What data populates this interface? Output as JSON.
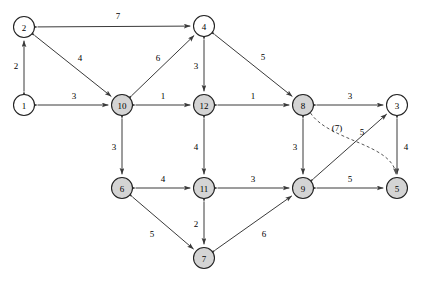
{
  "figure": {
    "width": 422,
    "height": 283,
    "background_color": "#ffffff",
    "node_fill_plain": "#ffffff",
    "node_fill_shaded": "#d4d4d4",
    "edge_color": "#3a3a3a",
    "dashed_edge_color": "#555555"
  },
  "chart_data": {
    "type": "diagram",
    "subtype": "directed-weighted-graph",
    "nodes": [
      {
        "id": "1",
        "label": "1",
        "x": 24,
        "y": 105,
        "style": "plain"
      },
      {
        "id": "2",
        "label": "2",
        "x": 24,
        "y": 27,
        "style": "plain"
      },
      {
        "id": "3",
        "label": "3",
        "x": 397,
        "y": 105,
        "style": "plain"
      },
      {
        "id": "4",
        "label": "4",
        "x": 204,
        "y": 26,
        "style": "plain"
      },
      {
        "id": "5",
        "label": "5",
        "x": 397,
        "y": 188,
        "style": "shaded"
      },
      {
        "id": "6",
        "label": "6",
        "x": 122,
        "y": 188,
        "style": "shaded"
      },
      {
        "id": "7",
        "label": "7",
        "x": 204,
        "y": 258,
        "style": "shaded"
      },
      {
        "id": "8",
        "label": "8",
        "x": 303,
        "y": 105,
        "style": "shaded"
      },
      {
        "id": "9",
        "label": "9",
        "x": 303,
        "y": 188,
        "style": "shaded"
      },
      {
        "id": "10",
        "label": "10",
        "x": 122,
        "y": 105,
        "style": "shaded"
      },
      {
        "id": "11",
        "label": "11",
        "x": 204,
        "y": 188,
        "style": "shaded"
      },
      {
        "id": "12",
        "label": "12",
        "x": 204,
        "y": 105,
        "style": "shaded"
      }
    ],
    "edges": [
      {
        "source": "2",
        "target": "4",
        "weight": "7",
        "label_x": 118,
        "label_y": 16,
        "direction": "both",
        "style": "solid"
      },
      {
        "source": "1",
        "target": "2",
        "weight": "2",
        "label_x": 16,
        "label_y": 66,
        "direction": "both",
        "style": "solid"
      },
      {
        "source": "2",
        "target": "10",
        "weight": "4",
        "label_x": 80,
        "label_y": 58,
        "direction": "both",
        "style": "solid"
      },
      {
        "source": "1",
        "target": "10",
        "weight": "3",
        "label_x": 74,
        "label_y": 96,
        "direction": "both",
        "style": "solid"
      },
      {
        "source": "10",
        "target": "4",
        "weight": "6",
        "label_x": 158,
        "label_y": 58,
        "direction": "both",
        "style": "solid"
      },
      {
        "source": "10",
        "target": "12",
        "weight": "1",
        "label_x": 163,
        "label_y": 96,
        "direction": "both",
        "style": "solid"
      },
      {
        "source": "4",
        "target": "12",
        "weight": "3",
        "label_x": 196,
        "label_y": 66,
        "direction": "both",
        "style": "solid"
      },
      {
        "source": "4",
        "target": "8",
        "weight": "5",
        "label_x": 263,
        "label_y": 57,
        "direction": "both",
        "style": "solid"
      },
      {
        "source": "12",
        "target": "8",
        "weight": "1",
        "label_x": 253,
        "label_y": 96,
        "direction": "both",
        "style": "solid"
      },
      {
        "source": "8",
        "target": "3",
        "weight": "3",
        "label_x": 350,
        "label_y": 96,
        "direction": "both",
        "style": "solid"
      },
      {
        "source": "10",
        "target": "6",
        "weight": "3",
        "label_x": 114,
        "label_y": 147,
        "direction": "both",
        "style": "solid"
      },
      {
        "source": "12",
        "target": "11",
        "weight": "4",
        "label_x": 196,
        "label_y": 147,
        "direction": "both",
        "style": "solid"
      },
      {
        "source": "8",
        "target": "9",
        "weight": "3",
        "label_x": 295,
        "label_y": 147,
        "direction": "both",
        "style": "solid"
      },
      {
        "source": "3",
        "target": "5",
        "weight": "4",
        "label_x": 406,
        "label_y": 147,
        "direction": "both",
        "style": "solid"
      },
      {
        "source": "6",
        "target": "11",
        "weight": "4",
        "label_x": 163,
        "label_y": 179,
        "direction": "both",
        "style": "solid"
      },
      {
        "source": "11",
        "target": "9",
        "weight": "3",
        "label_x": 253,
        "label_y": 179,
        "direction": "both",
        "style": "solid"
      },
      {
        "source": "9",
        "target": "5",
        "weight": "5",
        "label_x": 350,
        "label_y": 179,
        "direction": "both",
        "style": "solid"
      },
      {
        "source": "9",
        "target": "3",
        "weight": "5",
        "label_x": 362,
        "label_y": 132,
        "direction": "both",
        "style": "solid"
      },
      {
        "source": "6",
        "target": "7",
        "weight": "5",
        "label_x": 152,
        "label_y": 234,
        "direction": "both",
        "style": "solid"
      },
      {
        "source": "11",
        "target": "7",
        "weight": "2",
        "label_x": 196,
        "label_y": 224,
        "direction": "both",
        "style": "solid"
      },
      {
        "source": "7",
        "target": "9",
        "weight": "6",
        "label_x": 264,
        "label_y": 234,
        "direction": "both",
        "style": "solid"
      },
      {
        "source": "8",
        "target": "5",
        "weight": "(7)",
        "label_x": 337,
        "label_y": 128,
        "direction": "both",
        "style": "dashed"
      }
    ],
    "legend": []
  }
}
